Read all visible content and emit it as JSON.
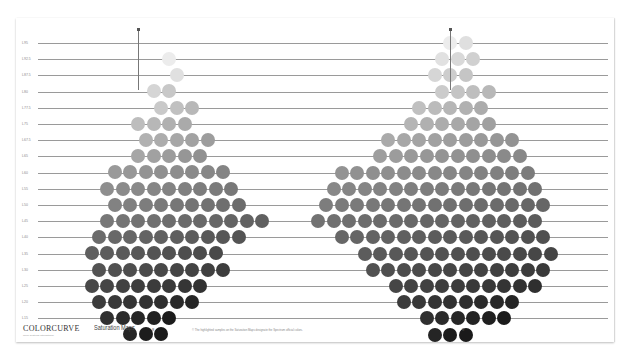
{
  "sheet": {
    "brand": "COLORCURVE",
    "brand_tagline": "Color Systems International",
    "title": "Saturation Maps",
    "footnote": "© The highlighted samples on the Saturation Maps designate the Spectrum official colors.",
    "center_mark_left": "8",
    "center_mark_right": "8",
    "row_labels": [
      "L95",
      "L92.5",
      "L87.5",
      "L80",
      "L77.5",
      "L75",
      "L67.5",
      "L65",
      "L60",
      "L55",
      "L50",
      "L45",
      "L40",
      "L35",
      "L30",
      "L25",
      "L20",
      "L15"
    ]
  },
  "chart_data": {
    "type": "heatmap",
    "title": "Saturation Maps",
    "layout": {
      "grid": true,
      "legend": "none",
      "rows": 18
    },
    "charts": [
      {
        "name": "left-map",
        "row_counts": [
          1,
          1,
          2,
          3,
          4,
          5,
          5,
          8,
          9,
          9,
          11,
          10,
          9,
          9,
          8,
          7,
          5,
          3
        ],
        "row_start_col": [
          2,
          2,
          1,
          1,
          0,
          0,
          0,
          -2,
          -2,
          -2,
          -2,
          -3,
          -3,
          -3,
          -3,
          -3,
          -2,
          -1
        ]
      },
      {
        "name": "right-map",
        "row_counts": [
          2,
          3,
          3,
          4,
          5,
          6,
          9,
          10,
          13,
          14,
          15,
          15,
          14,
          13,
          12,
          10,
          8,
          6,
          3
        ],
        "row_start_col": [
          0,
          -1,
          -1,
          -1,
          -2,
          -3,
          -4,
          -5,
          -7,
          -8,
          -8,
          -9,
          -7,
          -6,
          -5,
          -4,
          -3,
          -2,
          -1
        ]
      }
    ]
  }
}
